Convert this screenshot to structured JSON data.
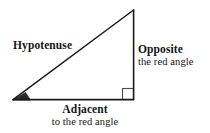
{
  "figure": {
    "kind": "right-triangle-diagram",
    "background_color": "#ffffff",
    "stroke_color": "#1a1a1a",
    "angle_fill_color": "#2b2b2b"
  },
  "labels": {
    "hypotenuse": {
      "primary": "Hypotenuse"
    },
    "opposite": {
      "primary": "Opposite",
      "secondary": "the red angle"
    },
    "adjacent": {
      "primary": "Adjacent",
      "secondary": "to the red angle"
    }
  },
  "markers": {
    "angle_wedge_name": "marked-angle",
    "right_angle_name": "right-angle-square"
  }
}
